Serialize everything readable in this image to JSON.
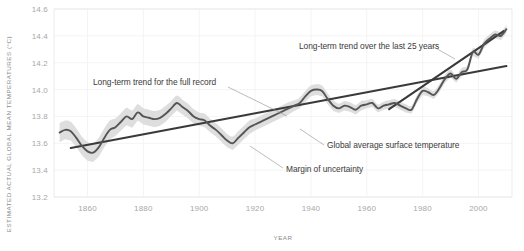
{
  "chart_data": {
    "type": "line",
    "title": "",
    "xlabel": "YEAR",
    "ylabel": "ESTIMATED ACTUAL GLOBAL MEAN TEMPERATURES (°C)",
    "xlim": [
      1848,
      2012
    ],
    "ylim": [
      13.2,
      14.6
    ],
    "xticks": [
      "1860",
      "1880",
      "1900",
      "1920",
      "1940",
      "1960",
      "1980",
      "2000"
    ],
    "xtick_values": [
      1860,
      1880,
      1900,
      1920,
      1940,
      1960,
      1980,
      2000
    ],
    "yticks": [
      "13.2",
      "13.4",
      "13.6",
      "13.8",
      "14.0",
      "14.2",
      "14.4",
      "14.6"
    ],
    "ytick_values": [
      13.2,
      13.4,
      13.6,
      13.8,
      14.0,
      14.2,
      14.4,
      14.6
    ],
    "grid": true,
    "legend": "none",
    "series": [
      {
        "name": "Global average surface temperature",
        "type": "line",
        "color": "#555555",
        "x": [
          1850,
          1852,
          1854,
          1856,
          1858,
          1860,
          1862,
          1864,
          1866,
          1868,
          1870,
          1872,
          1874,
          1876,
          1878,
          1880,
          1882,
          1884,
          1886,
          1888,
          1890,
          1892,
          1894,
          1896,
          1898,
          1900,
          1902,
          1904,
          1906,
          1908,
          1910,
          1912,
          1914,
          1916,
          1918,
          1920,
          1922,
          1924,
          1926,
          1928,
          1930,
          1932,
          1934,
          1936,
          1938,
          1940,
          1942,
          1944,
          1946,
          1948,
          1950,
          1952,
          1954,
          1956,
          1958,
          1960,
          1962,
          1964,
          1966,
          1968,
          1970,
          1972,
          1974,
          1976,
          1978,
          1980,
          1982,
          1984,
          1986,
          1988,
          1990,
          1992,
          1994,
          1996,
          1998,
          2000,
          2002,
          2004,
          2006,
          2008,
          2010
        ],
        "y": [
          13.68,
          13.7,
          13.69,
          13.64,
          13.58,
          13.54,
          13.53,
          13.57,
          13.64,
          13.7,
          13.72,
          13.76,
          13.8,
          13.78,
          13.83,
          13.8,
          13.79,
          13.78,
          13.79,
          13.82,
          13.86,
          13.9,
          13.87,
          13.84,
          13.8,
          13.78,
          13.77,
          13.73,
          13.7,
          13.66,
          13.62,
          13.6,
          13.64,
          13.68,
          13.72,
          13.74,
          13.76,
          13.78,
          13.8,
          13.82,
          13.84,
          13.86,
          13.88,
          13.9,
          13.95,
          13.99,
          14.0,
          13.99,
          13.93,
          13.88,
          13.86,
          13.88,
          13.87,
          13.85,
          13.88,
          13.89,
          13.9,
          13.86,
          13.88,
          13.89,
          13.9,
          13.88,
          13.86,
          13.85,
          13.93,
          13.99,
          13.98,
          13.96,
          14.01,
          14.08,
          14.12,
          14.08,
          14.13,
          14.15,
          14.28,
          14.26,
          14.34,
          14.38,
          14.41,
          14.4,
          14.45
        ],
        "uncertainty_half_width": [
          0.07,
          0.07,
          0.07,
          0.07,
          0.07,
          0.07,
          0.07,
          0.07,
          0.07,
          0.07,
          0.065,
          0.065,
          0.065,
          0.065,
          0.06,
          0.06,
          0.06,
          0.06,
          0.06,
          0.06,
          0.055,
          0.055,
          0.055,
          0.055,
          0.055,
          0.05,
          0.05,
          0.05,
          0.05,
          0.05,
          0.05,
          0.05,
          0.05,
          0.05,
          0.05,
          0.045,
          0.045,
          0.045,
          0.045,
          0.045,
          0.045,
          0.045,
          0.04,
          0.04,
          0.04,
          0.04,
          0.04,
          0.04,
          0.04,
          0.04,
          0.035,
          0.035,
          0.035,
          0.035,
          0.035,
          0.03,
          0.03,
          0.03,
          0.03,
          0.03,
          0.03,
          0.03,
          0.03,
          0.03,
          0.03,
          0.03,
          0.03,
          0.03,
          0.03,
          0.03,
          0.03,
          0.03,
          0.03,
          0.03,
          0.03,
          0.03,
          0.03,
          0.03,
          0.03,
          0.03,
          0.03
        ]
      },
      {
        "name": "Long-term trend for the full record",
        "type": "trendline",
        "color": "#3a3a3a",
        "x": [
          1854,
          2010
        ],
        "y": [
          13.565,
          14.175
        ]
      },
      {
        "name": "Long-term trend over the last 25 years",
        "type": "trendline",
        "color": "#3a3a3a",
        "x": [
          1968,
          2009
        ],
        "y": [
          13.855,
          14.435
        ]
      }
    ],
    "annotations": [
      {
        "id": "annot-full-record",
        "text": "Long-term trend for the full record",
        "text_x": 93,
        "text_y": 85,
        "anchor": "start",
        "leader": [
          [
            228,
            87
          ],
          [
            287,
            116
          ]
        ]
      },
      {
        "id": "annot-last-25",
        "text": "Long-term trend over the last 25 years",
        "text_x": 299,
        "text_y": 49,
        "anchor": "start",
        "leader": [
          [
            432,
            46
          ],
          [
            455,
            59
          ]
        ]
      },
      {
        "id": "annot-global-average",
        "text": "Global average surface temperature",
        "text_x": 327,
        "text_y": 148,
        "anchor": "start",
        "leader": [
          [
            324,
            145
          ],
          [
            300,
            129
          ]
        ]
      },
      {
        "id": "annot-margin",
        "text": "Margin of uncertainty",
        "text_x": 286,
        "text_y": 172,
        "anchor": "start",
        "leader": [
          [
            283,
            168
          ],
          [
            250,
            146
          ]
        ]
      }
    ]
  },
  "colors": {
    "data_line": "#555555",
    "trend_line": "#3a3a3a",
    "uncertainty_band": "#dcdcdc",
    "grid": "#f1f1f1",
    "axis_text": "#a8a8a8",
    "axis_title": "#8a8a8a",
    "annotation_text": "#3b3b3b",
    "background": "#ffffff"
  }
}
